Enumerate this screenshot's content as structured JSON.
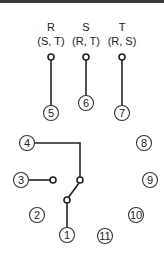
{
  "diagram": {
    "type": "relay-pin-wiring",
    "top_labels": [
      {
        "phase": "R",
        "sub": "(S, T)"
      },
      {
        "phase": "S",
        "sub": "(R, T)"
      },
      {
        "phase": "T",
        "sub": "(R, S)"
      }
    ],
    "pins": [
      "1",
      "2",
      "3",
      "4",
      "5",
      "6",
      "7",
      "8",
      "9",
      "10",
      "11"
    ],
    "colors": {
      "line": "#222222",
      "background": "#ffffff",
      "border": "#3a3a3a"
    }
  }
}
